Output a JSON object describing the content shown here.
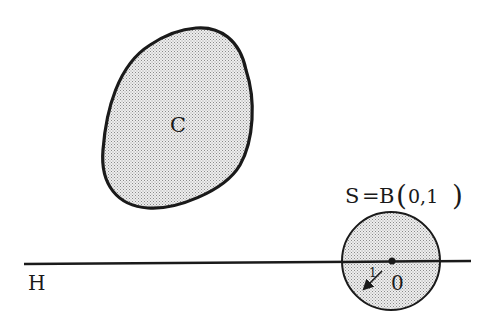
{
  "labels": {
    "set_c": "C",
    "hyperplane": "H",
    "sphere": "S = B(0,1)",
    "sphere_left": "S",
    "sphere_eq": "=",
    "sphere_b": "B",
    "sphere_args": "0,1",
    "origin": "0",
    "radius": "1"
  },
  "colors": {
    "stroke": "#1a1a1a",
    "fill": "#d9d9d9",
    "background": "#ffffff"
  }
}
